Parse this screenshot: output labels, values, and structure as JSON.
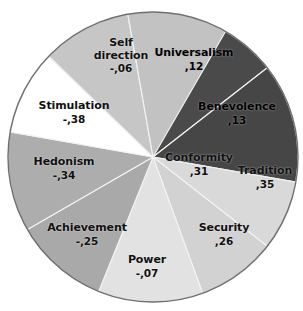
{
  "chart_data": {
    "type": "pie",
    "title": "",
    "subtitle": "",
    "xlabel": "",
    "ylabel": "",
    "legend_position": "none",
    "grid": false,
    "value_format": "decimal-comma",
    "note": "Grayscale pie of Schwartz value types with correlation values shown as data labels.",
    "categories": [
      "Universalism",
      "Benevolence",
      "Tradition",
      "Conformity",
      "Security",
      "Power",
      "Achievement",
      "Hedonism",
      "Stimulation",
      "Self direction"
    ],
    "labels_display": [
      ",12",
      ",13",
      ",35",
      ",31",
      ",26",
      "-,07",
      "-,25",
      "-,34",
      "-,38",
      "-,06"
    ],
    "values": [
      0.12,
      0.13,
      0.35,
      0.31,
      0.26,
      -0.07,
      -0.25,
      -0.34,
      -0.38,
      -0.06
    ],
    "slice_angles_deg": [
      52,
      48,
      28,
      32,
      42,
      38,
      40,
      34,
      36,
      40
    ],
    "colors": [
      "#4a4a4a",
      "#464646",
      "#d9d9d9",
      "#d2d2d2",
      "#e2e2e2",
      "#a9a9a9",
      "#adadad",
      "#ffffff",
      "#c6c6c6",
      "#c2c2c2"
    ],
    "slices": [
      {
        "name": "Universalism",
        "value_display": ",12",
        "value": 0.12,
        "color": "#4a4a4a",
        "start_deg": 0,
        "sweep_deg": 52,
        "label_on_dark": true
      },
      {
        "name": "Benevolence",
        "value_display": ",13",
        "value": 0.13,
        "color": "#464646",
        "start_deg": 52,
        "sweep_deg": 48,
        "label_on_dark": true
      },
      {
        "name": "Tradition",
        "value_display": ",35",
        "value": 0.35,
        "color": "#d9d9d9",
        "start_deg": 100,
        "sweep_deg": 28,
        "label_on_dark": false
      },
      {
        "name": "Conformity",
        "value_display": ",31",
        "value": 0.31,
        "color": "#d2d2d2",
        "start_deg": 128,
        "sweep_deg": 32,
        "label_on_dark": false
      },
      {
        "name": "Security",
        "value_display": ",26",
        "value": 0.26,
        "color": "#e2e2e2",
        "start_deg": 160,
        "sweep_deg": 42,
        "label_on_dark": false
      },
      {
        "name": "Power",
        "value_display": "-,07",
        "value": -0.07,
        "color": "#a9a9a9",
        "start_deg": 202,
        "sweep_deg": 38,
        "label_on_dark": false
      },
      {
        "name": "Achievement",
        "value_display": "-,25",
        "value": -0.25,
        "color": "#adadad",
        "start_deg": 240,
        "sweep_deg": 40,
        "label_on_dark": false
      },
      {
        "name": "Hedonism",
        "value_display": "-,34",
        "value": -0.34,
        "color": "#ffffff",
        "start_deg": 280,
        "sweep_deg": 34,
        "label_on_dark": false
      },
      {
        "name": "Stimulation",
        "value_display": "-,38",
        "value": -0.38,
        "color": "#c6c6c6",
        "start_deg": 314,
        "sweep_deg": 36,
        "label_on_dark": false
      },
      {
        "name": "Self direction",
        "value_display": "-,06",
        "value": -0.06,
        "color": "#c2c2c2",
        "start_deg": 350,
        "sweep_deg": 40,
        "label_on_dark": false
      }
    ]
  },
  "labels": {
    "universalism": {
      "name": "Universalism",
      "value": ",12"
    },
    "benevolence": {
      "name": "Benevolence",
      "value": ",13"
    },
    "tradition": {
      "name": "Tradition",
      "value": ",35"
    },
    "conformity": {
      "name": "Conformity",
      "value": ",31"
    },
    "security": {
      "name": "Security",
      "value": ",26"
    },
    "power": {
      "name": "Power",
      "value": "-,07"
    },
    "achievement": {
      "name": "Achievement",
      "value": "-,25"
    },
    "hedonism": {
      "name": "Hedonism",
      "value": "-,34"
    },
    "stimulation": {
      "name": "Stimulation",
      "value": "-,38"
    },
    "self_direction": {
      "name_line1": "Self",
      "name_line2": "direction",
      "value": "-,06"
    }
  },
  "geometry": {
    "center_x": 153,
    "center_y": 157,
    "radius": 145,
    "outline_color": "#6f6f6f",
    "separator_color": "#f2f2f2"
  }
}
